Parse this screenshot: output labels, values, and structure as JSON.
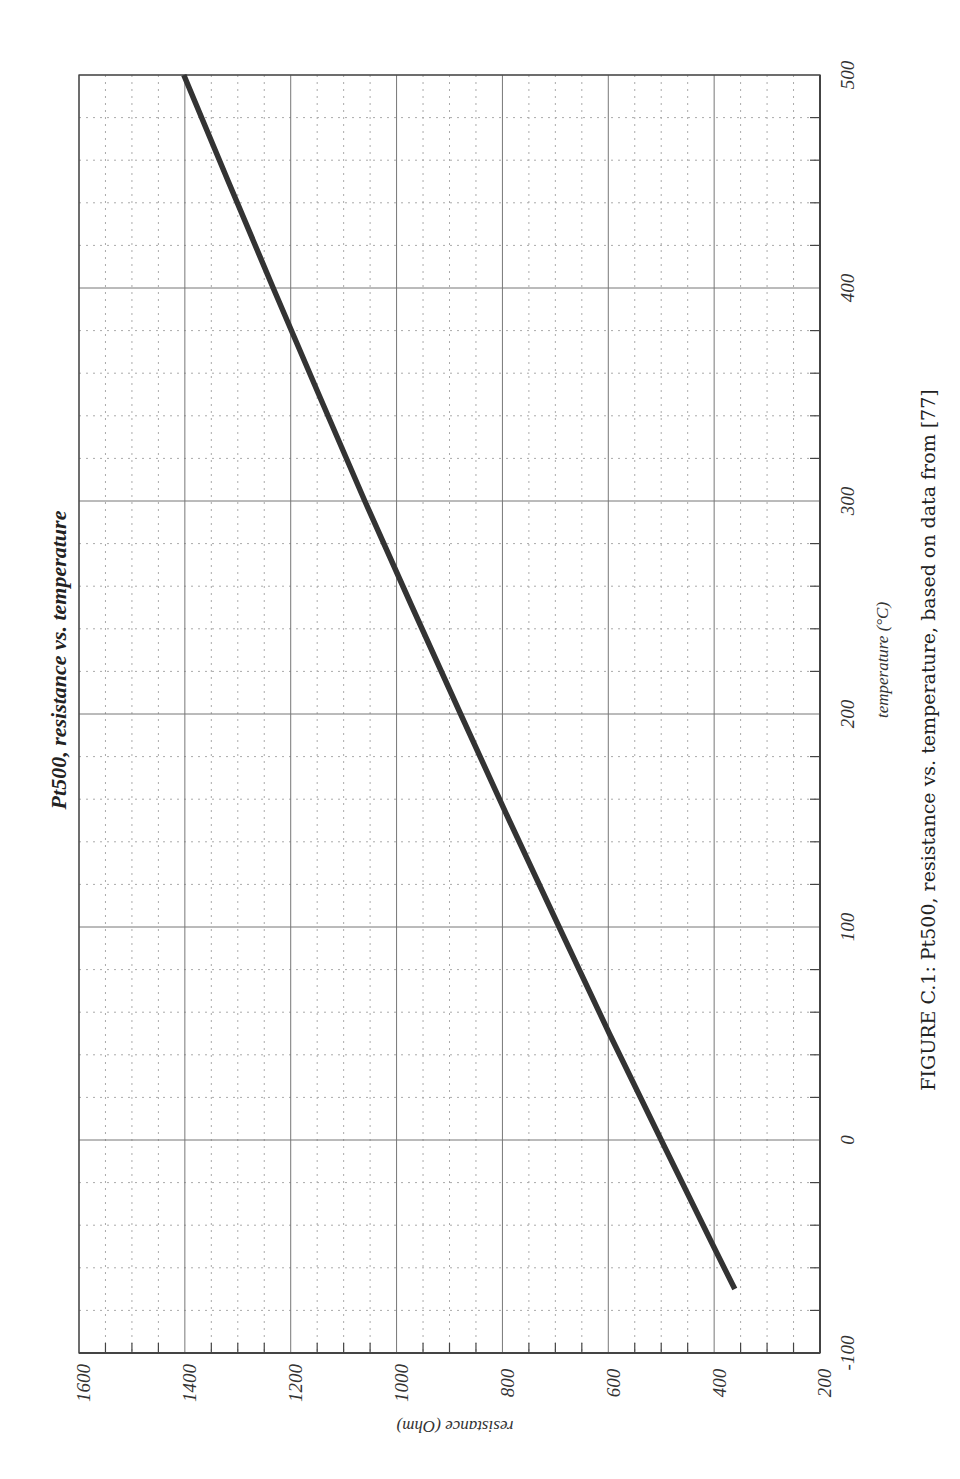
{
  "page": {
    "caption": "FIGURE C.1: Pt500, resistance vs. temperature, based on data from [77]",
    "orientation": "rotated-90-ccw"
  },
  "chart_data": {
    "type": "line",
    "title": "Pt500, resistance vs. temperature",
    "xlabel": "temperature (°C)",
    "ylabel": "resistance (Ohm)",
    "xlim": [
      -100,
      500
    ],
    "ylim": [
      200,
      1600
    ],
    "x_ticks": [
      -100,
      0,
      100,
      200,
      300,
      400,
      500
    ],
    "y_ticks": [
      200,
      400,
      600,
      800,
      1000,
      1200,
      1400,
      1600
    ],
    "x_minor_step": 20,
    "y_minor_step": 50,
    "grid": true,
    "legend": null,
    "series": [
      {
        "name": "Pt500",
        "color": "#333333",
        "x": [
          -70,
          -50,
          0,
          50,
          100,
          150,
          200,
          250,
          300,
          350,
          400,
          450,
          500
        ],
        "values": [
          361,
          401,
          500,
          598,
          693,
          787,
          879,
          970,
          1060,
          1147,
          1233,
          1318,
          1402
        ]
      }
    ]
  },
  "colors": {
    "major_grid": "#777777",
    "minor_grid": "#aaaaaa",
    "axis": "#444444",
    "line": "#333333",
    "background": "#ffffff"
  }
}
